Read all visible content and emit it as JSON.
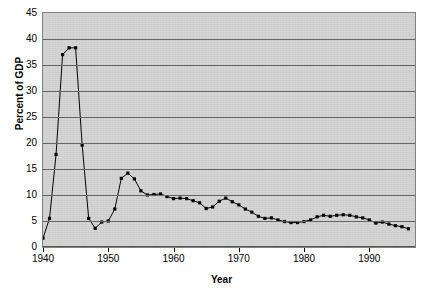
{
  "chart_data": {
    "type": "line",
    "title": "",
    "xlabel": "Year",
    "ylabel": "Percent of GDP",
    "xlim": [
      1940,
      1997
    ],
    "ylim": [
      0,
      45
    ],
    "ytick_step": 5,
    "xtick_step": 10,
    "grid": "horizontal",
    "legend": "none",
    "marker": "square",
    "line_color": "#000000",
    "marker_color": "#000000",
    "plot_background": "#d4d4d4",
    "gridline_color": "#666666",
    "yticks": [
      0,
      5,
      10,
      15,
      20,
      25,
      30,
      35,
      40,
      45
    ],
    "xticks": [
      1940,
      1950,
      1960,
      1970,
      1980,
      1990
    ],
    "x": [
      1940,
      1941,
      1942,
      1943,
      1944,
      1945,
      1946,
      1947,
      1948,
      1949,
      1950,
      1951,
      1952,
      1953,
      1954,
      1955,
      1956,
      1957,
      1958,
      1959,
      1960,
      1961,
      1962,
      1963,
      1964,
      1965,
      1966,
      1967,
      1968,
      1969,
      1970,
      1971,
      1972,
      1973,
      1974,
      1975,
      1976,
      1977,
      1978,
      1979,
      1980,
      1981,
      1982,
      1983,
      1984,
      1985,
      1986,
      1987,
      1988,
      1989,
      1990,
      1991,
      1992,
      1993,
      1994,
      1995,
      1996
    ],
    "values": [
      1.7,
      5.5,
      17.8,
      37.0,
      38.3,
      38.3,
      19.6,
      5.5,
      3.6,
      4.8,
      5.0,
      7.3,
      13.2,
      14.2,
      13.1,
      10.8,
      10.0,
      10.1,
      10.2,
      9.7,
      9.3,
      9.4,
      9.3,
      8.9,
      8.5,
      7.4,
      7.7,
      8.8,
      9.4,
      8.7,
      8.1,
      7.3,
      6.7,
      5.9,
      5.5,
      5.6,
      5.2,
      4.9,
      4.7,
      4.7,
      4.9,
      5.2,
      5.8,
      6.1,
      5.9,
      6.1,
      6.2,
      6.1,
      5.8,
      5.6,
      5.2,
      4.6,
      4.8,
      4.4,
      4.1,
      3.9,
      3.5
    ]
  },
  "axes": {
    "y_title": "Percent of GDP",
    "x_title": "Year",
    "y_tick_labels": [
      "0",
      "5",
      "10",
      "15",
      "20",
      "25",
      "30",
      "35",
      "40",
      "45"
    ],
    "x_tick_labels": [
      "1940",
      "1950",
      "1960",
      "1970",
      "1980",
      "1990"
    ]
  }
}
